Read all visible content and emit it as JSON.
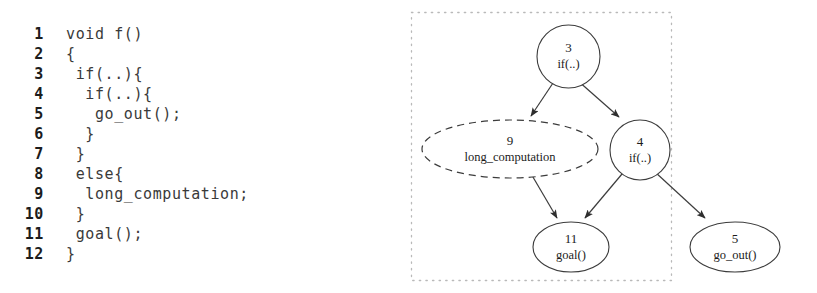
{
  "code": {
    "language": "c",
    "lines": [
      {
        "number": "1",
        "text": "void f()"
      },
      {
        "number": "2",
        "text": "{"
      },
      {
        "number": "3",
        "text": " if(..){"
      },
      {
        "number": "4",
        "text": "  if(..){"
      },
      {
        "number": "5",
        "text": "   go_out();"
      },
      {
        "number": "6",
        "text": "  }"
      },
      {
        "number": "7",
        "text": " }"
      },
      {
        "number": "8",
        "text": " else{"
      },
      {
        "number": "9",
        "text": "  long_computation;"
      },
      {
        "number": "10",
        "text": " }"
      },
      {
        "number": "11",
        "text": " goal();"
      },
      {
        "number": "12",
        "text": "}"
      }
    ]
  },
  "graph": {
    "type": "control-flow-graph",
    "region_box": {
      "label": ""
    },
    "nodes": [
      {
        "id": "n3",
        "number": "3",
        "signature": "if(..)",
        "shape": "circle",
        "style": "solid"
      },
      {
        "id": "n9",
        "number": "9",
        "signature": "long_computation",
        "shape": "ellipse",
        "style": "dashed"
      },
      {
        "id": "n4",
        "number": "4",
        "signature": "if(..)",
        "shape": "circle",
        "style": "solid"
      },
      {
        "id": "n11",
        "number": "11",
        "signature": "goal()",
        "shape": "ellipse",
        "style": "solid"
      },
      {
        "id": "n5",
        "number": "5",
        "signature": "go_out()",
        "shape": "ellipse",
        "style": "solid"
      }
    ],
    "edges": [
      {
        "from": "n3",
        "to": "n9"
      },
      {
        "from": "n3",
        "to": "n4"
      },
      {
        "from": "n9",
        "to": "n11"
      },
      {
        "from": "n4",
        "to": "n11"
      },
      {
        "from": "n4",
        "to": "n5"
      }
    ]
  },
  "colors": {
    "stroke": "#3c3c3c",
    "text": "#1b1b1b",
    "region_border": "#b9b9b9",
    "background": "#ffffff"
  }
}
